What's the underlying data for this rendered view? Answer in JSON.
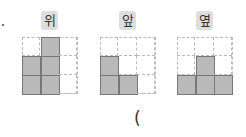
{
  "views": [
    {
      "label": "위",
      "cells": [
        [
          0,
          1,
          0
        ],
        [
          1,
          1,
          0
        ],
        [
          1,
          1,
          0
        ]
      ]
    },
    {
      "label": "앞",
      "cells": [
        [
          0,
          0,
          0
        ],
        [
          1,
          0,
          0
        ],
        [
          1,
          1,
          0
        ]
      ]
    },
    {
      "label": "옆",
      "cells": [
        [
          0,
          0,
          0
        ],
        [
          0,
          1,
          0
        ],
        [
          1,
          1,
          1
        ]
      ]
    }
  ],
  "answer_paren": "(",
  "colors": {
    "filled": "#b9b9b9",
    "label_bg": "#dedede"
  }
}
